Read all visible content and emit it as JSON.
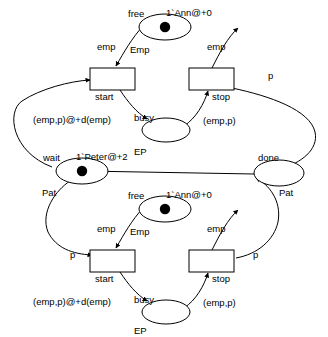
{
  "diagram": {
    "kind": "colored-petri-net",
    "title": "",
    "colors": {
      "stroke": "#000000",
      "fill": "#ffffff",
      "token": "#000000",
      "background": "#ffffff"
    },
    "nets": [
      {
        "id": "upper",
        "places": [
          {
            "name": "free",
            "label": "free",
            "type": "Emp",
            "marking": "1`Ann@+0",
            "tokens": 1
          },
          {
            "name": "busy",
            "label": "busy",
            "type": "EP",
            "marking": "",
            "tokens": 0
          }
        ],
        "transitions": [
          {
            "name": "start",
            "label": "start"
          },
          {
            "name": "stop",
            "label": "stop"
          }
        ],
        "arcs": [
          {
            "from": "free",
            "to": "start",
            "inscription": "emp"
          },
          {
            "from": "stop",
            "to": "free",
            "inscription": "emp"
          },
          {
            "from": "start",
            "to": "busy",
            "inscription": "(emp,p)@+d(emp)"
          },
          {
            "from": "busy",
            "to": "stop",
            "inscription": "(emp,p)"
          },
          {
            "from": "wait",
            "to": "start",
            "inscription": ""
          },
          {
            "from": "stop",
            "to": "done",
            "inscription": "p"
          }
        ]
      },
      {
        "id": "lower",
        "places": [
          {
            "name": "free",
            "label": "free",
            "type": "Emp",
            "marking": "1`Ann@+0",
            "tokens": 1
          },
          {
            "name": "busy",
            "label": "busy",
            "type": "EP",
            "marking": "",
            "tokens": 0
          }
        ],
        "transitions": [
          {
            "name": "start",
            "label": "start"
          },
          {
            "name": "stop",
            "label": "stop"
          }
        ],
        "arcs": [
          {
            "from": "free",
            "to": "start",
            "inscription": "emp"
          },
          {
            "from": "stop",
            "to": "free",
            "inscription": "emp"
          },
          {
            "from": "start",
            "to": "busy",
            "inscription": "(emp,p)@+d(emp)"
          },
          {
            "from": "busy",
            "to": "stop",
            "inscription": "(emp,p)"
          },
          {
            "from": "wait",
            "to": "start",
            "inscription": "p"
          },
          {
            "from": "stop",
            "to": "done",
            "inscription": "p"
          }
        ]
      }
    ],
    "shared_places": [
      {
        "name": "wait",
        "label": "wait",
        "type": "Pat",
        "marking": "1`Peter@+2",
        "tokens": 1
      },
      {
        "name": "done",
        "label": "done",
        "type": "Pat",
        "marking": "",
        "tokens": 0
      }
    ],
    "labels": {
      "free": "free",
      "busy": "busy",
      "wait": "wait",
      "done": "done",
      "start": "start",
      "stop": "stop",
      "type_emp": "Emp",
      "type_ep": "EP",
      "type_pat": "Pat",
      "marking_ann": "1`Ann@+0",
      "marking_peter": "1`Peter@+2",
      "arc_emp": "emp",
      "arc_p": "p",
      "arc_emp_p": "(emp,p)",
      "arc_emp_p_delay": "(emp,p)@+d(emp)"
    }
  }
}
